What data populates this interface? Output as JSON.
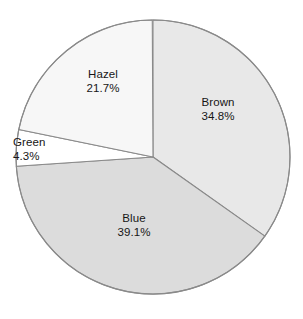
{
  "chart_data": {
    "type": "pie",
    "title": "",
    "subtitle": "",
    "xlabel": "",
    "ylabel": "",
    "legend_position": "none",
    "labels_inside_slices": true,
    "start_angle_deg": 0,
    "direction": "clockwise",
    "categories": [
      "Brown",
      "Blue",
      "Green",
      "Hazel"
    ],
    "values": [
      34.8,
      39.1,
      4.3,
      21.7
    ],
    "value_unit": "%",
    "slices": [
      {
        "name": "Brown",
        "label": "Brown",
        "value": 34.8,
        "percent_text": "34.8%",
        "angle_deg": 125.3,
        "color": "#e8e8e8"
      },
      {
        "name": "Blue",
        "label": "Blue",
        "value": 39.1,
        "percent_text": "39.1%",
        "angle_deg": 140.8,
        "color": "#dcdcdc"
      },
      {
        "name": "Green",
        "label": "Green",
        "value": 4.3,
        "percent_text": "4.3%",
        "angle_deg": 15.5,
        "color": "#ffffff"
      },
      {
        "name": "Hazel",
        "label": "Hazel",
        "value": 21.7,
        "percent_text": "21.7%",
        "angle_deg": 78.1,
        "color": "#f7f7f7"
      }
    ],
    "geometry": {
      "center_x": 153,
      "center_y": 157,
      "radius": 137
    },
    "style": {
      "background": "#ffffff",
      "stroke": "#8a8a8a",
      "text_color": "#161616"
    }
  }
}
